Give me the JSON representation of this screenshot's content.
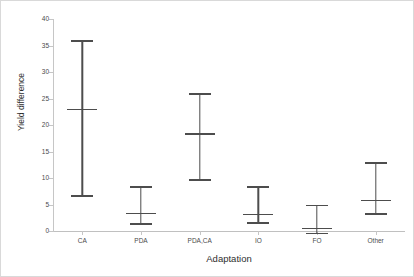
{
  "chart_data": {
    "type": "scatter",
    "title": "",
    "xlabel": "Adaptation",
    "ylabel": "Yield difference",
    "categories": [
      "CA",
      "PDA",
      "PDA,CA",
      "IO",
      "FO",
      "Other"
    ],
    "ylim": [
      0,
      40
    ],
    "yticks": [
      0,
      5,
      10,
      15,
      20,
      25,
      30,
      35,
      40
    ],
    "ytick_labels": [
      "0",
      "5",
      "10",
      "15",
      "20",
      "25",
      "30",
      "35",
      "40"
    ],
    "grid": false,
    "legend": "none",
    "series": [
      {
        "name": "Yield difference",
        "marker": "error-bar-with-mean",
        "color": "#4d4d4d",
        "points": [
          {
            "category": "CA",
            "mean": 23.0,
            "low": 6.8,
            "high": 36.0
          },
          {
            "category": "PDA",
            "mean": 3.4,
            "low": 1.5,
            "high": 8.5
          },
          {
            "category": "PDA,CA",
            "mean": 18.4,
            "low": 9.8,
            "high": 26.0
          },
          {
            "category": "IO",
            "mean": 3.3,
            "low": 1.7,
            "high": 8.4
          },
          {
            "category": "FO",
            "mean": 0.6,
            "low": -0.3,
            "high": 5.0
          },
          {
            "category": "Other",
            "mean": 5.9,
            "low": 3.4,
            "high": 13.0
          }
        ]
      }
    ]
  },
  "axes": {
    "y_title": "Yield difference",
    "x_title": "Adaptation"
  },
  "colors": {
    "series": "#4d4d4d",
    "axis": "#c6c6c6",
    "text": "#4a4a4a",
    "border": "#d9d9d9",
    "background": "#ffffff"
  }
}
